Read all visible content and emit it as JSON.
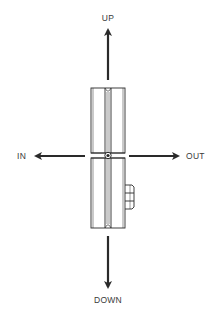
{
  "diagram": {
    "type": "direction-indicator",
    "labels": {
      "up": "UP",
      "down": "DOWN",
      "in": "IN",
      "out": "OUT"
    },
    "colors": {
      "line": "#2a2a2a",
      "arrow": "#2a2a2a",
      "label": "#3a3a3a",
      "background": "#ffffff"
    }
  }
}
